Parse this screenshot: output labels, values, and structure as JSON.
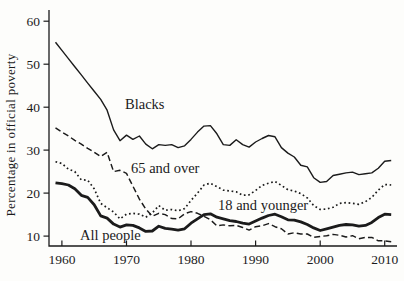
{
  "figure": {
    "background": "#fdfdfb",
    "ink": "#1b1b1b"
  },
  "chart_data": {
    "type": "line",
    "title": "",
    "xlabel": "",
    "ylabel": "Percentage in official poverty",
    "grid": false,
    "legend_position": "inline-labels",
    "xlim": [
      1958,
      2011.9
    ],
    "ylim": [
      7.7,
      62.6
    ],
    "x_ticks": [
      1960,
      1970,
      1980,
      1990,
      2000,
      2010
    ],
    "y_ticks": [
      10,
      20,
      30,
      40,
      50,
      60
    ],
    "x": [
      1959,
      1960,
      1961,
      1962,
      1963,
      1964,
      1965,
      1966,
      1967,
      1968,
      1969,
      1970,
      1971,
      1972,
      1973,
      1974,
      1975,
      1976,
      1977,
      1978,
      1979,
      1980,
      1981,
      1982,
      1983,
      1984,
      1985,
      1986,
      1987,
      1988,
      1989,
      1990,
      1991,
      1992,
      1993,
      1994,
      1995,
      1996,
      1997,
      1998,
      1999,
      2000,
      2001,
      2002,
      2003,
      2004,
      2005,
      2006,
      2007,
      2008,
      2009,
      2010,
      2011
    ],
    "series": [
      {
        "name": "Blacks",
        "style": "solid-thin",
        "values": [
          55.1,
          53.2,
          51.3,
          49.4,
          47.5,
          45.6,
          43.7,
          41.8,
          39.3,
          34.7,
          32.2,
          33.5,
          32.5,
          33.3,
          31.4,
          30.3,
          31.3,
          31.1,
          31.3,
          30.6,
          31.0,
          32.5,
          34.2,
          35.6,
          35.7,
          33.8,
          31.3,
          31.1,
          32.4,
          31.3,
          30.7,
          31.9,
          32.7,
          33.4,
          33.1,
          30.6,
          29.3,
          28.4,
          26.5,
          26.1,
          23.6,
          22.5,
          22.7,
          24.1,
          24.4,
          24.7,
          24.9,
          24.3,
          24.5,
          24.7,
          25.8,
          27.4,
          27.6
        ]
      },
      {
        "name": "65 and over",
        "style": "dashed",
        "values": [
          35.2,
          34.2,
          33.3,
          32.3,
          31.4,
          30.4,
          29.5,
          28.5,
          29.5,
          25.0,
          25.3,
          24.6,
          21.6,
          18.6,
          16.3,
          14.6,
          15.3,
          15.0,
          14.1,
          14.0,
          15.2,
          15.7,
          15.3,
          14.6,
          13.8,
          12.4,
          12.6,
          12.4,
          12.5,
          12.0,
          11.4,
          12.2,
          12.4,
          12.9,
          12.2,
          11.7,
          10.5,
          10.8,
          10.5,
          10.5,
          9.7,
          9.9,
          10.1,
          10.4,
          10.2,
          9.8,
          10.1,
          9.4,
          9.7,
          9.7,
          8.9,
          8.9,
          8.7
        ]
      },
      {
        "name": "18 and younger",
        "style": "dotted",
        "values": [
          27.3,
          26.9,
          25.6,
          25.0,
          23.1,
          23.0,
          21.0,
          17.6,
          16.6,
          15.6,
          14.0,
          15.1,
          15.3,
          15.1,
          14.4,
          15.4,
          17.1,
          16.0,
          16.2,
          15.9,
          16.4,
          18.3,
          20.0,
          21.9,
          22.3,
          21.5,
          20.7,
          20.5,
          20.3,
          19.5,
          19.6,
          20.6,
          21.8,
          22.3,
          22.7,
          21.8,
          20.8,
          20.5,
          19.9,
          18.9,
          17.1,
          16.2,
          16.3,
          16.7,
          17.6,
          17.8,
          17.6,
          17.4,
          18.0,
          19.0,
          20.7,
          22.0,
          21.9
        ]
      },
      {
        "name": "All people",
        "style": "solid-thick",
        "values": [
          22.4,
          22.2,
          21.9,
          21.0,
          19.5,
          19.0,
          17.3,
          14.7,
          14.2,
          12.8,
          12.1,
          12.6,
          12.5,
          11.9,
          11.1,
          11.2,
          12.3,
          11.8,
          11.6,
          11.4,
          11.7,
          13.0,
          14.0,
          15.0,
          15.2,
          14.4,
          14.0,
          13.6,
          13.4,
          13.0,
          12.8,
          13.5,
          14.2,
          14.8,
          15.1,
          14.5,
          13.8,
          13.7,
          13.3,
          12.7,
          11.9,
          11.3,
          11.7,
          12.1,
          12.5,
          12.7,
          12.6,
          12.3,
          12.5,
          13.2,
          14.3,
          15.1,
          15.0
        ]
      }
    ],
    "annotations": [
      {
        "text": "Blacks",
        "x": 125,
        "y": 109
      },
      {
        "text": "65 and over",
        "x": 131,
        "y": 173
      },
      {
        "text": "18 and younger",
        "x": 218,
        "y": 210
      },
      {
        "text": "All people",
        "x": 80,
        "y": 240
      }
    ]
  }
}
